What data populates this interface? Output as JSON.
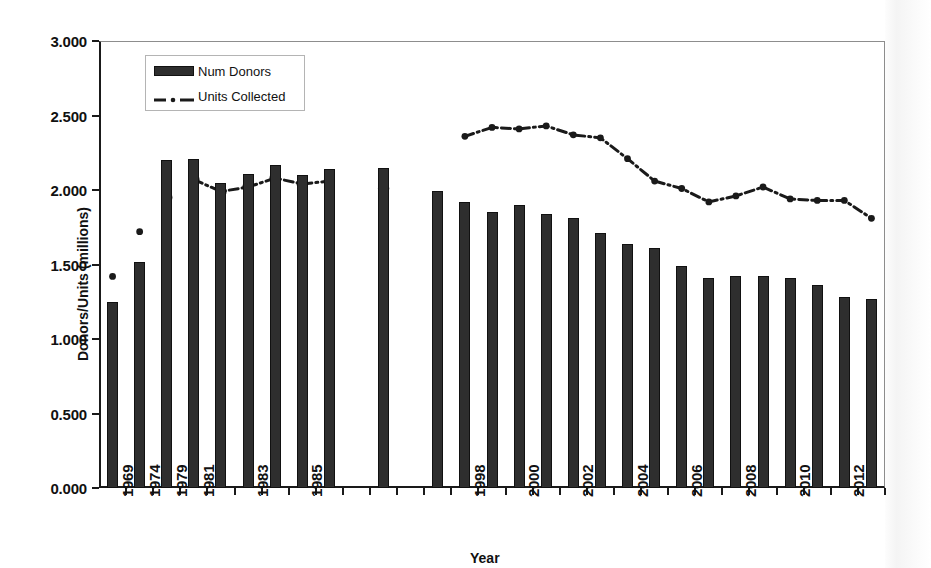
{
  "figure": {
    "ylabel": "Donors/Units (millions)",
    "xlabel": "Year",
    "legend": {
      "bar_label": "Num Donors",
      "line_label": "Units Collected"
    }
  },
  "chart_data": {
    "type": "bar",
    "title": "",
    "xlabel": "Year",
    "ylabel": "Donors/Units (millions)",
    "ylim": [
      0,
      3.0
    ],
    "ytick_labels": [
      "0.000",
      "0.500",
      "1.000",
      "1.500",
      "2.000",
      "2.500",
      "3.000"
    ],
    "ytick_values": [
      0,
      0.5,
      1.0,
      1.5,
      2.0,
      2.5,
      3.0
    ],
    "grid": false,
    "legend_position": "top-left-inside",
    "xtick_labels": [
      "1969",
      "1974",
      "1979",
      "1981",
      "1983",
      "1985",
      "1998",
      "2000",
      "2002",
      "2004",
      "2006",
      "2008",
      "2010",
      "2012"
    ],
    "categories": [
      "1969",
      "1974",
      "1979",
      "1981",
      "1982",
      "1983",
      "1984",
      "1985",
      "1986",
      "1989",
      "1997",
      "1998",
      "1999",
      "2000",
      "2001",
      "2002",
      "2003",
      "2004",
      "2005",
      "2006",
      "2007",
      "2008",
      "2009",
      "2010",
      "2011",
      "2012",
      "2013"
    ],
    "series": [
      {
        "name": "Num Donors",
        "type": "bar",
        "values": [
          1.25,
          1.52,
          2.2,
          2.21,
          2.05,
          2.11,
          2.17,
          2.1,
          2.14,
          2.15,
          1.99,
          1.92,
          1.85,
          1.9,
          1.84,
          1.81,
          1.71,
          1.64,
          1.61,
          1.49,
          1.41,
          1.42,
          1.42,
          1.41,
          1.36,
          1.28,
          1.27
        ]
      },
      {
        "name": "Units Collected",
        "type": "line",
        "marker": "open-circle-early, filled-circle-late",
        "values": [
          1.42,
          1.72,
          1.95,
          2.07,
          1.99,
          2.02,
          2.08,
          2.04,
          2.06,
          2.01,
          null,
          2.36,
          2.42,
          2.41,
          2.43,
          2.37,
          2.35,
          2.21,
          2.06,
          2.01,
          1.92,
          1.96,
          2.02,
          1.94,
          1.93,
          1.93,
          1.81
        ]
      }
    ]
  }
}
